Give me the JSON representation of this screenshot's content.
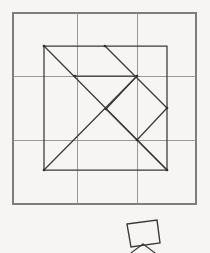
{
  "figure": {
    "background_color": "#fbfbfa",
    "ink_color": "#3a3a3a",
    "grid_color": "#8f8f8f"
  },
  "grid": {
    "name": "background-grid",
    "frame": {
      "x": 13,
      "y": 13,
      "width": 183,
      "height": 191
    },
    "vertical_lines": [
      77,
      137
    ],
    "horizontal_lines": [
      76,
      140
    ],
    "columns": 3,
    "rows": 3
  },
  "tangram": {
    "name": "tangram-square",
    "outline": [
      {
        "x": 44,
        "y": 46
      },
      {
        "x": 167,
        "y": 46
      },
      {
        "x": 167,
        "y": 170
      },
      {
        "x": 44,
        "y": 170
      }
    ],
    "cut_lines": [
      {
        "id": "main-diagonal",
        "from": {
          "x": 44,
          "y": 46
        },
        "to": {
          "x": 167,
          "y": 170
        }
      },
      {
        "id": "upper-right-diagonal",
        "from": {
          "x": 105,
          "y": 46
        },
        "to": {
          "x": 167,
          "y": 108
        }
      },
      {
        "id": "mid-horizontal",
        "from": {
          "x": 75,
          "y": 76
        },
        "to": {
          "x": 137,
          "y": 76
        }
      },
      {
        "id": "square-upper-left",
        "from": {
          "x": 137,
          "y": 76
        },
        "to": {
          "x": 106,
          "y": 109
        }
      },
      {
        "id": "square-lower-left",
        "from": {
          "x": 106,
          "y": 109
        },
        "to": {
          "x": 137,
          "y": 140
        }
      },
      {
        "id": "square-lower-right",
        "from": {
          "x": 137,
          "y": 140
        },
        "to": {
          "x": 167,
          "y": 108
        }
      },
      {
        "id": "lower-left-diagonal",
        "from": {
          "x": 44,
          "y": 170
        },
        "to": {
          "x": 137,
          "y": 76
        }
      },
      {
        "id": "lower-right-diagonal",
        "from": {
          "x": 137,
          "y": 140
        },
        "to": {
          "x": 167,
          "y": 170
        }
      }
    ],
    "vertices": [
      {
        "x": 44,
        "y": 46
      },
      {
        "x": 105,
        "y": 46
      },
      {
        "x": 75,
        "y": 76
      },
      {
        "x": 137,
        "y": 76
      },
      {
        "x": 106,
        "y": 109
      },
      {
        "x": 167,
        "y": 108
      },
      {
        "x": 137,
        "y": 140
      },
      {
        "x": 44,
        "y": 170
      },
      {
        "x": 167,
        "y": 170
      }
    ]
  },
  "detached_piece": {
    "name": "small-square-piece",
    "outline": [
      {
        "x": 127,
        "y": 224
      },
      {
        "x": 157,
        "y": 220
      },
      {
        "x": 160,
        "y": 243
      },
      {
        "x": 131,
        "y": 247
      }
    ],
    "stand_legs": [
      {
        "from": {
          "x": 143,
          "y": 244
        },
        "to": {
          "x": 131,
          "y": 253
        }
      },
      {
        "from": {
          "x": 143,
          "y": 244
        },
        "to": {
          "x": 155,
          "y": 253
        }
      }
    ]
  }
}
